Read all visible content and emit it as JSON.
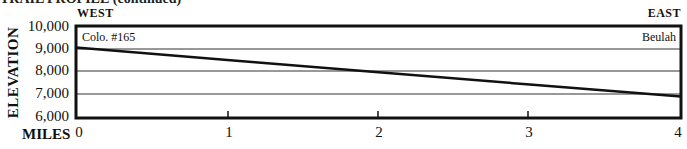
{
  "header": {
    "title_partial": "TRAIL PROFILE (continued)",
    "west_label": "WEST",
    "east_label": "EAST"
  },
  "chart_data": {
    "type": "line",
    "title": "Trail Profile",
    "xlabel": "MILES",
    "ylabel": "ELEVATION",
    "x_ticks": [
      "0",
      "1",
      "2",
      "3",
      "4"
    ],
    "y_ticks": [
      "10,000",
      "9,000",
      "8,000",
      "7,000",
      "6,000"
    ],
    "xlim": [
      0,
      4
    ],
    "ylim": [
      6000,
      10000
    ],
    "grid": "horizontal",
    "series": [
      {
        "name": "Elevation profile",
        "x": [
          0,
          1,
          2,
          3,
          4
        ],
        "y": [
          9050,
          8510,
          7970,
          7430,
          6900
        ]
      }
    ],
    "annotations": [
      {
        "text": "Colo. #165",
        "x": 0,
        "position": "top-left"
      },
      {
        "text": "Beulah",
        "x": 4,
        "position": "top-right"
      }
    ],
    "direction_labels": {
      "left": "WEST",
      "right": "EAST"
    }
  }
}
